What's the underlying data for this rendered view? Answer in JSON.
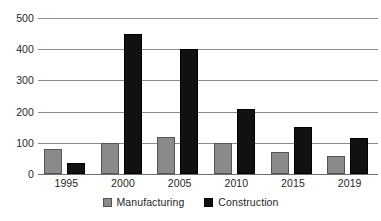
{
  "chart_data": {
    "type": "bar",
    "title": "",
    "subtitle": "",
    "xlabel": "",
    "ylabel": "",
    "categories": [
      "1995",
      "2000",
      "2005",
      "2010",
      "2015",
      "2019"
    ],
    "series": [
      {
        "name": "Manufacturing",
        "color": "#8a8a8a",
        "values": [
          80,
          100,
          120,
          100,
          70,
          58
        ]
      },
      {
        "name": "Construction",
        "color": "#111111",
        "values": [
          35,
          448,
          400,
          208,
          150,
          115
        ]
      }
    ],
    "ylim": [
      0,
      500
    ],
    "yticks": [
      0,
      100,
      200,
      300,
      400,
      500
    ],
    "ytick_labels": [
      "0",
      "100",
      "200",
      "300",
      "400",
      "500"
    ],
    "grid": true,
    "grid_axis": "y",
    "legend_position": "bottom-center",
    "annotations": []
  },
  "legend": {
    "items": [
      {
        "label": "Manufacturing",
        "swatch": "manufacturing-swatch"
      },
      {
        "label": "Construction",
        "swatch": "construction-swatch"
      }
    ]
  }
}
